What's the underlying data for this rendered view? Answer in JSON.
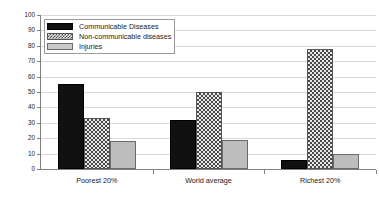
{
  "chart_data": {
    "type": "bar",
    "title": "",
    "subtitle": "",
    "xlabel": "",
    "ylabel": "Percentage of deaths",
    "categories": [
      "Poorest 20%",
      "World average",
      "Richest 20%"
    ],
    "series": [
      {
        "name": "Communicable Diseases",
        "values": [
          55,
          32,
          6
        ],
        "swatch": "black-solid"
      },
      {
        "name": "Non-communicable diseases",
        "values": [
          33,
          50,
          78
        ],
        "swatch": "checker-hatch"
      },
      {
        "name": "Injuries",
        "values": [
          18,
          19,
          10
        ],
        "swatch": "gray-solid"
      }
    ],
    "ylim": [
      0,
      100
    ],
    "ytick_step": 10,
    "ytick_labels": [
      "0",
      "10",
      "20",
      "30",
      "40",
      "50",
      "60",
      "70",
      "80",
      "90",
      "100"
    ],
    "grid": true,
    "grid_axis": "y",
    "legend_position": "top-left",
    "colors": {
      "series_0": "#111111",
      "series_1": "#e8e8e8",
      "series_2": "#bdbdbd",
      "gridline": "#d8d8d8",
      "axis": "#808080",
      "text": "#1a1a1a",
      "background": "#ffffff"
    }
  }
}
